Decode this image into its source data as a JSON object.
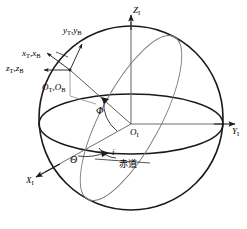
{
  "figure": {
    "background_color": "#ffffff",
    "stroke_color": "#1a1a1a",
    "thin_stroke_color": "#6b6b6b",
    "width": 247,
    "height": 229
  },
  "axes": {
    "z_inertial": {
      "symbol": "Z",
      "subscript": "I",
      "label": "Z_I"
    },
    "y_inertial": {
      "symbol": "Y",
      "subscript": "I",
      "label": "Y_I"
    },
    "x_inertial": {
      "symbol": "X",
      "subscript": "I",
      "label": "X_I"
    },
    "origin_inertial": {
      "symbol": "O",
      "subscript": "I",
      "label": "O_I"
    }
  },
  "body_frame": {
    "x_axis": {
      "first": "x",
      "first_sub": "T",
      "second": "x",
      "second_sub": "B",
      "separator": ","
    },
    "y_axis": {
      "first": "y",
      "first_sub": "T",
      "second": "y",
      "second_sub": "B",
      "separator": ","
    },
    "z_axis": {
      "first": "z",
      "first_sub": "T",
      "second": "z",
      "second_sub": "B",
      "separator": ","
    },
    "origin": {
      "first": "O",
      "first_sub": "T",
      "second": "O",
      "second_sub": "B",
      "separator": ","
    }
  },
  "angles": {
    "phi": {
      "glyph": "Φ",
      "name": "phi-angle"
    },
    "theta": {
      "glyph": "Θ",
      "name": "theta-angle"
    },
    "inclination": {
      "glyph": "i",
      "name": "inclination-angle"
    }
  },
  "annotations": {
    "equator": {
      "text": "赤道",
      "meaning": "equator"
    }
  }
}
